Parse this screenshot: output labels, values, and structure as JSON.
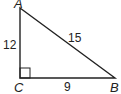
{
  "figure": {
    "type": "right-triangle",
    "vertices": [
      {
        "name": "A",
        "label": "A"
      },
      {
        "name": "B",
        "label": "B"
      },
      {
        "name": "C",
        "label": "C"
      }
    ],
    "sides": {
      "AC": "12",
      "CB": "9",
      "AB": "15"
    },
    "right_angle_at": "C",
    "stroke_color": "#222222"
  }
}
